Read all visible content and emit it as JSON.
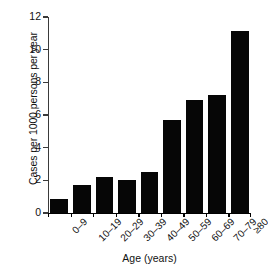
{
  "chart_data": {
    "type": "bar",
    "title": "",
    "xlabel": "Age (years)",
    "ylabel": "Cases per 1000 persons per year",
    "categories": [
      "0–9",
      "10–19",
      "20–29",
      "30–39",
      "40–49",
      "50–59",
      "60–69",
      "70–79",
      "≥80"
    ],
    "values": [
      0.85,
      1.7,
      2.2,
      2.05,
      2.5,
      5.7,
      6.9,
      7.25,
      11.15
    ],
    "ylim": [
      0,
      12
    ],
    "yticks": [
      0,
      2,
      4,
      6,
      8,
      10,
      12
    ],
    "ytick_labels": [
      "0",
      "2",
      "4",
      "6",
      "8",
      "10",
      "12"
    ],
    "xtick_rotation": -45,
    "grid": false,
    "legend": "none",
    "bar_color": "#060606",
    "axis_color": "#000000",
    "background_color": "#ffffff"
  }
}
